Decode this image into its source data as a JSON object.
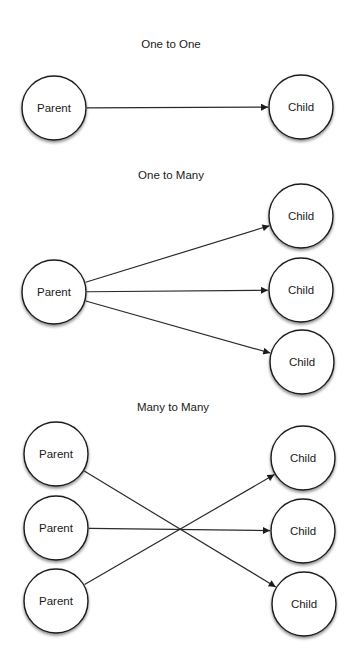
{
  "diagram": {
    "sections": [
      {
        "id": "one-to-one",
        "title": "One to One",
        "nodes": [
          {
            "id": "p1",
            "label": "Parent",
            "role": "parent"
          },
          {
            "id": "c1",
            "label": "Child",
            "role": "child"
          }
        ],
        "edges": [
          {
            "from": "p1",
            "to": "c1"
          }
        ]
      },
      {
        "id": "one-to-many",
        "title": "One to Many",
        "nodes": [
          {
            "id": "p1",
            "label": "Parent",
            "role": "parent"
          },
          {
            "id": "c1",
            "label": "Child",
            "role": "child"
          },
          {
            "id": "c2",
            "label": "Child",
            "role": "child"
          },
          {
            "id": "c3",
            "label": "Child",
            "role": "child"
          }
        ],
        "edges": [
          {
            "from": "p1",
            "to": "c1"
          },
          {
            "from": "p1",
            "to": "c2"
          },
          {
            "from": "p1",
            "to": "c3"
          }
        ]
      },
      {
        "id": "many-to-many",
        "title": "Many to Many",
        "nodes": [
          {
            "id": "p1",
            "label": "Parent",
            "role": "parent"
          },
          {
            "id": "p2",
            "label": "Parent",
            "role": "parent"
          },
          {
            "id": "p3",
            "label": "Parent",
            "role": "parent"
          },
          {
            "id": "c1",
            "label": "Child",
            "role": "child"
          },
          {
            "id": "c2",
            "label": "Child",
            "role": "child"
          },
          {
            "id": "c3",
            "label": "Child",
            "role": "child"
          }
        ],
        "edges": [
          {
            "from": "p1",
            "to": "c3"
          },
          {
            "from": "p2",
            "to": "c2"
          },
          {
            "from": "p3",
            "to": "c1"
          }
        ]
      }
    ]
  }
}
